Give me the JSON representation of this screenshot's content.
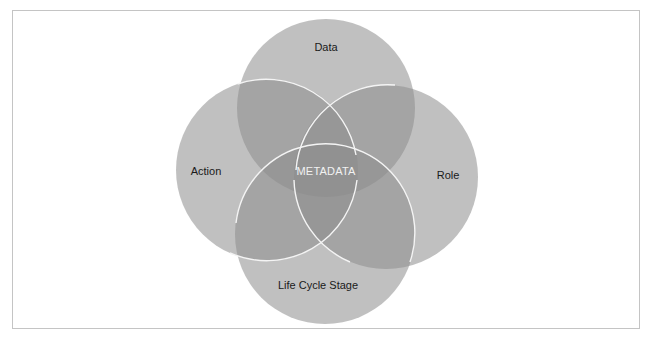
{
  "diagram": {
    "type": "venn",
    "center_label": "METADATA",
    "sets": [
      {
        "id": "data",
        "label": "Data",
        "cx": 326,
        "cy": 108,
        "r": 89
      },
      {
        "id": "action",
        "label": "Action",
        "cx": 267,
        "cy": 170,
        "r": 91
      },
      {
        "id": "role",
        "label": "Role",
        "cx": 386,
        "cy": 177,
        "r": 92
      },
      {
        "id": "lifecycle",
        "label": "Life Cycle Stage",
        "cx": 325,
        "cy": 234,
        "r": 90
      }
    ],
    "colors": {
      "circle_fill": "#8a8a8a",
      "circle_opacity": 0.55,
      "outline": "#f2f2f2",
      "frame_border": "#c4c4c4"
    }
  }
}
